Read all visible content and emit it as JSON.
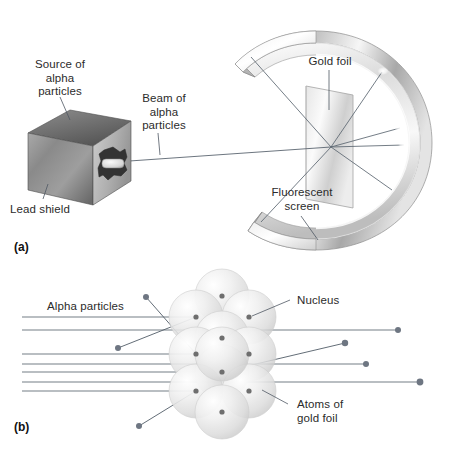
{
  "figure": {
    "background": "#ffffff",
    "width": 449,
    "height": 456
  },
  "panel_a": {
    "tag": "(a)",
    "labels": {
      "source": "Source of\nalpha\nparticles",
      "lead_shield": "Lead shield",
      "beam": "Beam of\nalpha\nparticles",
      "gold_foil": "Gold foil",
      "fluorescent_screen": "Fluorescent\nscreen"
    }
  },
  "panel_b": {
    "tag": "(b)",
    "labels": {
      "alpha_particles": "Alpha particles",
      "nucleus": "Nucleus",
      "atoms_of_gold_foil": "Atoms of\ngold foil"
    },
    "atom_count": 11,
    "straight_ray_count": 7,
    "deflected_ray_count": 4
  },
  "colors": {
    "line": "#555f6a",
    "text": "#2b2b2b",
    "atom_light": "#f2f2f2",
    "atom_mid": "#d8d8d8",
    "atom_edge": "#bfbfbf",
    "nucleus": "#6b6b6b",
    "metal_light": "#fbfbfb",
    "metal_mid": "#c9c9c9",
    "metal_dark": "#8e8e8e",
    "shield_light": "#d0d0d0",
    "shield_dark": "#6e6e6e",
    "cavity": "#3a3a3a"
  }
}
